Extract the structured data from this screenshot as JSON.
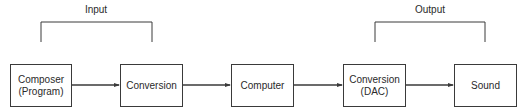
{
  "diagram": {
    "type": "block-flow",
    "direction": "left-to-right",
    "groups": [
      {
        "id": "input",
        "label": "Input",
        "spans": [
          "composer",
          "conversion_in"
        ]
      },
      {
        "id": "output",
        "label": "Output",
        "spans": [
          "conversion_dac",
          "sound"
        ]
      }
    ],
    "nodes": [
      {
        "id": "composer",
        "lines": [
          "Composer",
          "(Program)"
        ]
      },
      {
        "id": "conversion_in",
        "lines": [
          "Conversion"
        ]
      },
      {
        "id": "computer",
        "lines": [
          "Computer"
        ]
      },
      {
        "id": "conversion_dac",
        "lines": [
          "Conversion",
          "(DAC)"
        ]
      },
      {
        "id": "sound",
        "lines": [
          "Sound"
        ]
      }
    ],
    "edges": [
      {
        "from": "composer",
        "to": "conversion_in"
      },
      {
        "from": "conversion_in",
        "to": "computer"
      },
      {
        "from": "computer",
        "to": "conversion_dac"
      },
      {
        "from": "conversion_dac",
        "to": "sound"
      }
    ],
    "colors": {
      "line": "#3a3a3a",
      "text": "#2a2a2a",
      "background": "#ffffff"
    }
  }
}
